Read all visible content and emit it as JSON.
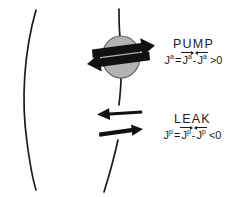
{
  "figure": {
    "title_region": "membrane-transport-pump-and-leak-diagram",
    "background_color": "#ffffff",
    "ink_color": "#1c1c1c",
    "pump_circle_fill": "#b3b3b3",
    "pump_circle_stroke": "#4a4a4a",
    "arrow_color": "#111111"
  },
  "pump": {
    "heading": "PUMP",
    "flux_symbol": "J",
    "flux_superscript": "a",
    "equals": "=",
    "minus": "-",
    "relation": ">",
    "zero": "0",
    "formula_plain": "Jᵃ = J⃗ᵃ - J⃖ᵃ > 0",
    "forward_arrow_direction": "right",
    "backward_arrow_direction": "left",
    "net_direction": "rightward",
    "top_arrow_direction": "right",
    "bottom_arrow_direction": "left"
  },
  "leak": {
    "heading": "LEAK",
    "flux_symbol": "J",
    "flux_superscript": "p",
    "equals": "=",
    "minus": "-",
    "relation": "<",
    "zero": "0",
    "formula_plain": "Jᵖ = J⃗ᵖ - J⃖ᵖ < 0",
    "top_arrow_direction": "left",
    "bottom_arrow_direction": "right",
    "top_arrow_weight": "thick",
    "bottom_arrow_weight": "thin",
    "net_direction": "leftward"
  },
  "membrane": {
    "left_curve_name": "left-membrane-leaflet",
    "right_curve_name": "right-membrane-leaflet",
    "stroke_width": 1.6
  }
}
